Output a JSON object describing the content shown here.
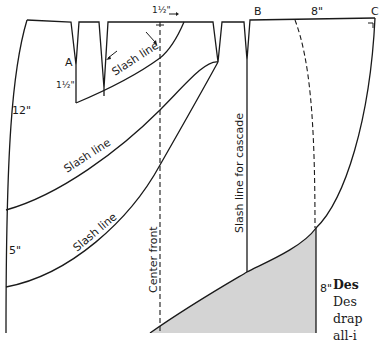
{
  "diagram": {
    "labels": {
      "point_a": "A",
      "point_b": "B",
      "point_c": "C",
      "dart_depth": "1½\"",
      "top_offset": "1½\"",
      "side_12": "12\"",
      "side_5": "5\"",
      "width_8_top": "8\"",
      "height_8_shaded": "8\"",
      "slash_line_1": "Slash line",
      "slash_line_2": "Slash line",
      "slash_line_3": "Slash line",
      "slash_line_cascade": "Slash line for cascade",
      "center_front": "Center front"
    },
    "caption": {
      "title": "Des",
      "lines": [
        "Des",
        "drap",
        "all-i"
      ]
    },
    "colors": {
      "stroke": "#1a1a1a",
      "shaded_fill": "#d4d4d4",
      "background": "#ffffff"
    }
  }
}
